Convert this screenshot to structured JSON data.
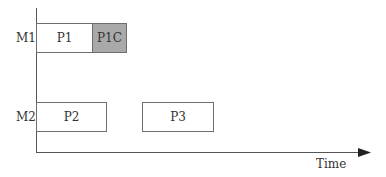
{
  "axes": {
    "x_label": "Time"
  },
  "machines": [
    {
      "label": "M1"
    },
    {
      "label": "M2"
    }
  ],
  "jobs": [
    {
      "label": "P1",
      "machine": "M1",
      "shaded": false
    },
    {
      "label": "P1C",
      "machine": "M1",
      "shaded": true
    },
    {
      "label": "P2",
      "machine": "M2",
      "shaded": false
    },
    {
      "label": "P3",
      "machine": "M2",
      "shaded": false
    }
  ],
  "colors": {
    "shaded_fill": "#a9a9a9",
    "border": "#6e6e6e",
    "axis": "#555555"
  }
}
